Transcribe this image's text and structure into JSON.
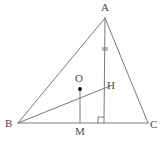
{
  "figure": {
    "type": "geometry-diagram",
    "width": 163,
    "height": 141,
    "background_color": "#ffffff",
    "stroke_color": "#6b6b6b",
    "label_color": "#4a4a4a",
    "point_color": "#000000",
    "stroke_width": 0.9
  },
  "labels": {
    "a": "A",
    "b": "B",
    "c": "C",
    "m": "M",
    "o": "O",
    "h": "H"
  },
  "points": {
    "A": {
      "x": 105,
      "y": 18,
      "label": "A",
      "label_x": 101,
      "label_y": 2
    },
    "B": {
      "x": 18,
      "y": 123,
      "label": "B",
      "label_x": 5,
      "label_y": 118
    },
    "C": {
      "x": 148,
      "y": 123,
      "label": "C",
      "label_x": 150,
      "label_y": 119
    },
    "M": {
      "x": 80,
      "y": 123,
      "label": "M",
      "label_x": 75,
      "label_y": 126
    },
    "O": {
      "x": 80,
      "y": 89,
      "label": "O",
      "label_x": 75,
      "label_y": 73
    },
    "H": {
      "x": 104,
      "y": 88,
      "label": "H",
      "label_x": 107,
      "label_y": 80
    },
    "D": {
      "x": 104,
      "y": 123,
      "label": "",
      "label_x": 0,
      "label_y": 0
    }
  },
  "segments": [
    {
      "name": "side-AB",
      "x1": 105,
      "y1": 18,
      "x2": 18,
      "y2": 123
    },
    {
      "name": "side-AC",
      "x1": 105,
      "y1": 18,
      "x2": 148,
      "y2": 123
    },
    {
      "name": "side-BC",
      "x1": 18,
      "y1": 123,
      "x2": 148,
      "y2": 123
    },
    {
      "name": "altitude-AD",
      "x1": 105,
      "y1": 18,
      "x2": 104,
      "y2": 123
    },
    {
      "name": "segment-BH",
      "x1": 18,
      "y1": 123,
      "x2": 110,
      "y2": 86
    },
    {
      "name": "segment-OM",
      "x1": 80,
      "y1": 89,
      "x2": 80,
      "y2": 123
    }
  ],
  "marks": {
    "tick": {
      "name": "congruence-tick-on-altitude",
      "x": 105,
      "y": 49,
      "half_width": 3,
      "gap": 2
    },
    "right_angle": {
      "name": "right-angle-at-foot-of-altitude",
      "x": 104,
      "y": 123,
      "size": 6
    }
  }
}
